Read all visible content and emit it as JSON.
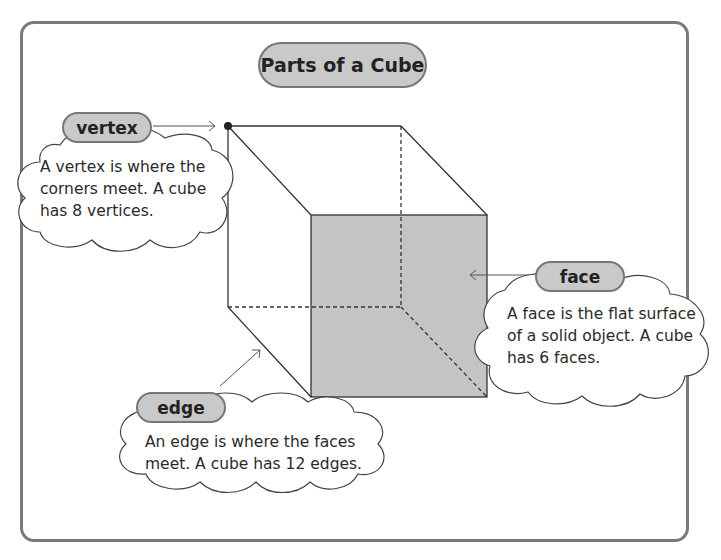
{
  "title": "Parts of a Cube",
  "labels": {
    "vertex": {
      "name": "vertex",
      "description": [
        "A vertex is where the",
        "corners meet. A cube",
        "has 8 vertices."
      ]
    },
    "face": {
      "name": "face",
      "description": [
        "A face is the flat surface",
        "of a solid object. A cube",
        "has 6 faces."
      ]
    },
    "edge": {
      "name": "edge",
      "description": [
        "An edge is where the faces",
        "meet. A cube has 12 edges."
      ]
    }
  },
  "colors": {
    "frame": "#7a7a7a",
    "pill_fill": "#c9c9c9",
    "face_fill": "#c4c4c4",
    "line": "#333333"
  }
}
